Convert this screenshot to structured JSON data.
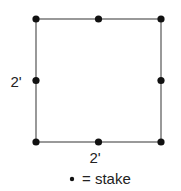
{
  "diagram": {
    "title": "",
    "shape": "square",
    "side_labels": {
      "left": "2'",
      "bottom": "2'"
    },
    "stakes": [
      {
        "id": "top-left",
        "col": 0,
        "row": 0
      },
      {
        "id": "top-middle",
        "col": 0.5,
        "row": 0
      },
      {
        "id": "top-right",
        "col": 1,
        "row": 0
      },
      {
        "id": "middle-left",
        "col": 0,
        "row": 0.5
      },
      {
        "id": "middle-right",
        "col": 1,
        "row": 0.5
      },
      {
        "id": "bottom-left",
        "col": 0,
        "row": 1
      },
      {
        "id": "bottom-middle",
        "col": 0.5,
        "row": 1
      },
      {
        "id": "bottom-right",
        "col": 1,
        "row": 1
      }
    ],
    "legend": {
      "symbol": "•",
      "text": "= stake"
    },
    "colors": {
      "line": "#555555",
      "stake": "#111111",
      "text": "#222222"
    }
  }
}
